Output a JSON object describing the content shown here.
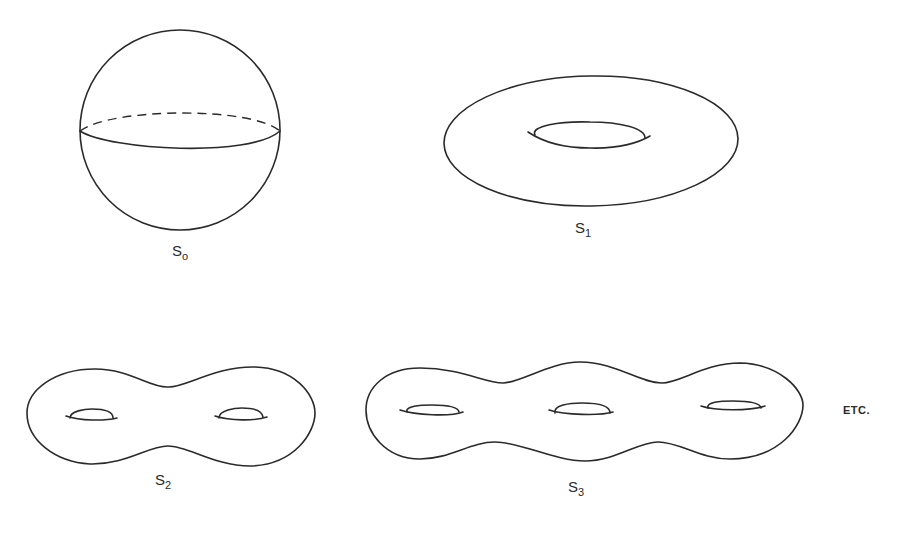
{
  "figure": {
    "surfaces": [
      {
        "id": "sphere",
        "label_base": "S",
        "label_sub": "o",
        "genus": 0,
        "holes": 0
      },
      {
        "id": "torus",
        "label_base": "S",
        "label_sub": "1",
        "genus": 1,
        "holes": 1
      },
      {
        "id": "double-torus",
        "label_base": "S",
        "label_sub": "2",
        "genus": 2,
        "holes": 2
      },
      {
        "id": "triple-torus",
        "label_base": "S",
        "label_sub": "3",
        "genus": 3,
        "holes": 3
      }
    ],
    "continuation_text": "ETC.",
    "colors": {
      "line": "#2a2a2a",
      "background": "#ffffff"
    }
  }
}
